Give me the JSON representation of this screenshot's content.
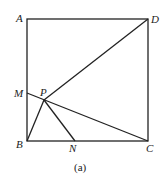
{
  "diagram": {
    "caption": "(a)",
    "points": {
      "A": {
        "label": "A",
        "x": 27,
        "y": 19
      },
      "D": {
        "label": "D",
        "x": 148,
        "y": 19
      },
      "B": {
        "label": "B",
        "x": 27,
        "y": 141
      },
      "C": {
        "label": "C",
        "x": 148,
        "y": 141
      },
      "M": {
        "label": "M",
        "x": 27,
        "y": 93
      },
      "P": {
        "label": "P",
        "x": 44,
        "y": 100
      },
      "N": {
        "label": "N",
        "x": 75,
        "y": 141
      }
    },
    "segments": [
      "AD",
      "DC",
      "CB",
      "BA",
      "PD",
      "MC",
      "PB",
      "PN"
    ]
  }
}
